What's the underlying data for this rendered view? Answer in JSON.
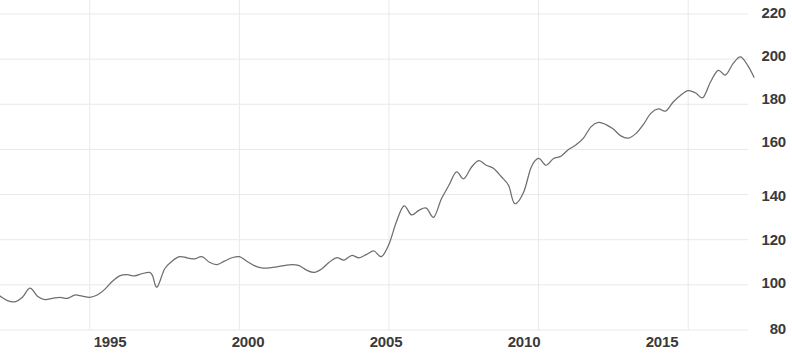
{
  "chart": {
    "type": "line",
    "title": "",
    "background_color": "#ffffff",
    "line_color": "#6e6e6e",
    "grid_color": "#e9e9e9",
    "label_color": "#3a3a3a"
  },
  "chart_data": {
    "type": "line",
    "title": "",
    "subtitle": "",
    "xlabel": "",
    "ylabel": "",
    "xlim": [
      1992.0,
      2017.0
    ],
    "ylim": [
      80,
      220
    ],
    "grid": true,
    "legend": "none",
    "y_ticks": [
      220,
      200,
      180,
      160,
      140,
      120,
      100,
      80
    ],
    "x_ticks": [
      1995,
      2000,
      2005,
      2010,
      2015
    ],
    "y_tick_labels": [
      "220",
      "200",
      "180",
      "160",
      "140",
      "120",
      "100",
      "80"
    ],
    "x_tick_labels": [
      "1995",
      "2000",
      "2005",
      "2010",
      "2015"
    ],
    "series": [
      {
        "name": "Index",
        "x": [
          1992.0,
          1992.25,
          1992.5,
          1992.75,
          1993.0,
          1993.25,
          1993.5,
          1993.75,
          1994.0,
          1994.25,
          1994.5,
          1994.75,
          1995.0,
          1995.25,
          1995.5,
          1995.75,
          1996.0,
          1996.25,
          1996.5,
          1996.75,
          1997.0,
          1997.1,
          1997.25,
          1997.5,
          1997.75,
          1998.0,
          1998.25,
          1998.5,
          1998.75,
          1999.0,
          1999.25,
          1999.5,
          1999.75,
          2000.0,
          2000.25,
          2000.5,
          2000.75,
          2001.0,
          2001.25,
          2001.5,
          2001.75,
          2002.0,
          2002.25,
          2002.5,
          2002.75,
          2003.0,
          2003.25,
          2003.5,
          2003.75,
          2004.0,
          2004.25,
          2004.5,
          2004.75,
          2005.0,
          2005.25,
          2005.5,
          2005.75,
          2006.0,
          2006.25,
          2006.5,
          2006.75,
          2007.0,
          2007.25,
          2007.5,
          2007.75,
          2008.0,
          2008.25,
          2008.5,
          2008.75,
          2009.0,
          2009.2,
          2009.5,
          2009.75,
          2010.0,
          2010.25,
          2010.5,
          2010.75,
          2011.0,
          2011.25,
          2011.5,
          2011.75,
          2012.0,
          2012.25,
          2012.5,
          2012.75,
          2013.0,
          2013.25,
          2013.5,
          2013.75,
          2014.0,
          2014.25,
          2014.5,
          2014.75,
          2015.0,
          2015.25,
          2015.5,
          2015.75,
          2016.0,
          2016.25,
          2016.5,
          2016.75,
          2017.0,
          2017.2
        ],
        "values": [
          95.0,
          93.0,
          92.5,
          94.5,
          98.5,
          95.0,
          93.5,
          94.0,
          94.5,
          94.0,
          95.5,
          95.0,
          94.5,
          95.5,
          98.0,
          101.5,
          104.0,
          104.5,
          104.0,
          105.0,
          105.5,
          104.0,
          99.0,
          107.0,
          110.5,
          112.5,
          112.0,
          111.5,
          112.5,
          110.0,
          109.0,
          110.5,
          112.0,
          112.5,
          110.5,
          108.5,
          107.5,
          107.5,
          108.0,
          108.5,
          109.0,
          108.5,
          106.5,
          105.5,
          107.0,
          110.0,
          112.0,
          111.0,
          113.0,
          112.0,
          113.5,
          115.0,
          112.5,
          118.0,
          128.0,
          135.0,
          131.0,
          133.0,
          134.0,
          130.0,
          138.0,
          144.0,
          150.0,
          147.0,
          152.0,
          155.0,
          153.0,
          151.5,
          148.0,
          144.0,
          136.0,
          141.0,
          152.0,
          156.0,
          153.0,
          156.0,
          157.0,
          160.0,
          162.0,
          165.0,
          170.0,
          172.0,
          171.0,
          169.0,
          166.0,
          165.0,
          167.0,
          171.0,
          176.0,
          178.0,
          177.0,
          181.0,
          184.0,
          186.0,
          185.0,
          183.0,
          190.0,
          195.0,
          193.0,
          198.0,
          201.0,
          197.0,
          192.0
        ]
      }
    ],
    "annotations": []
  },
  "y_axis": {
    "ticks": [
      {
        "label": "220",
        "y": 14
      },
      {
        "label": "200",
        "y": 57
      },
      {
        "label": "180",
        "y": 100
      },
      {
        "label": "160",
        "y": 143
      },
      {
        "label": "140",
        "y": 197
      },
      {
        "label": "120",
        "y": 241
      },
      {
        "label": "100",
        "y": 284
      },
      {
        "label": "80",
        "y": 330
      }
    ]
  },
  "x_axis": {
    "ticks": [
      {
        "label": "1995",
        "x": 110
      },
      {
        "label": "2000",
        "x": 248
      },
      {
        "label": "2005",
        "x": 386
      },
      {
        "label": "2010",
        "x": 524
      },
      {
        "label": "2015",
        "x": 662
      }
    ]
  }
}
